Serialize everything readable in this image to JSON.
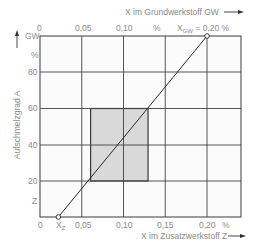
{
  "chart_data": {
    "type": "line",
    "title": "",
    "top_axis": {
      "label": "X im Grundwerkstoff  GW",
      "ticks": [
        "0",
        "0,05",
        "0,10",
        "%"
      ],
      "annotation": "X_GW = 0,20 %",
      "annotation_main": "X",
      "annotation_sub": "GW",
      "annotation_rest": " = 0,20 %"
    },
    "bottom_axis": {
      "label": "X im Zusatzwerkstoff  Z",
      "ticks": [
        "0",
        "0,05",
        "0,10",
        "0,15",
        "0,20",
        "%"
      ],
      "xz_label_main": "X",
      "xz_label_sub": "Z",
      "range": [
        0,
        0.25
      ]
    },
    "left_axis": {
      "label": "Aufschmelzgrad  A",
      "ticks": [
        "GW",
        "%",
        "80",
        "60",
        "40",
        "20",
        "Z"
      ],
      "range": [
        0,
        100
      ]
    },
    "series": [
      {
        "name": "Mischungsgerade",
        "points": [
          {
            "label": "X_Z",
            "x_z": 0.022,
            "a": 0
          },
          {
            "label": "X_GW",
            "x_z": 0.2,
            "a": 100
          }
        ]
      }
    ],
    "shaded_region": {
      "x_min": 0.06,
      "x_max": 0.13,
      "a_min": 20,
      "a_max": 60
    },
    "grid": true,
    "legend": "none"
  }
}
